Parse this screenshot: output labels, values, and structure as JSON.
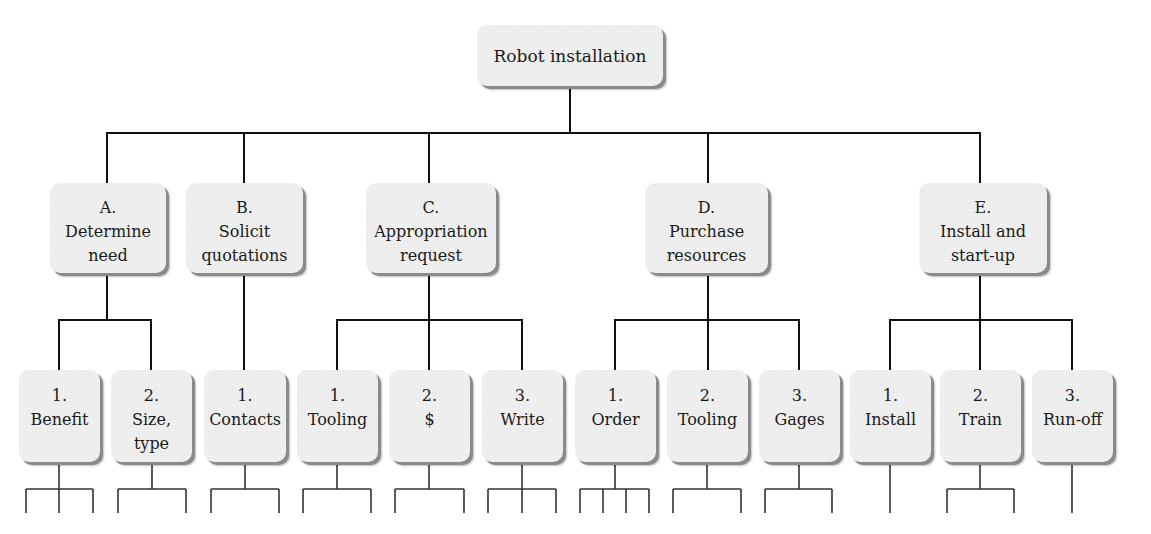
{
  "root": {
    "label": "Robot installation"
  },
  "branches": [
    {
      "letter": "A.",
      "line1": "Determine",
      "line2": "need",
      "children": [
        {
          "num": "1.",
          "line1": "Benefit",
          "line2": ""
        },
        {
          "num": "2.",
          "line1": "Size,",
          "line2": "type"
        }
      ]
    },
    {
      "letter": "B.",
      "line1": "Solicit",
      "line2": "quotations",
      "children": [
        {
          "num": "1.",
          "line1": "Contacts",
          "line2": ""
        }
      ]
    },
    {
      "letter": "C.",
      "line1": "Appropriation",
      "line2": "request",
      "children": [
        {
          "num": "1.",
          "line1": "Tooling",
          "line2": ""
        },
        {
          "num": "2.",
          "line1": "$",
          "line2": ""
        },
        {
          "num": "3.",
          "line1": "Write",
          "line2": ""
        }
      ]
    },
    {
      "letter": "D.",
      "line1": "Purchase",
      "line2": "resources",
      "children": [
        {
          "num": "1.",
          "line1": "Order",
          "line2": ""
        },
        {
          "num": "2.",
          "line1": "Tooling",
          "line2": ""
        },
        {
          "num": "3.",
          "line1": "Gages",
          "line2": ""
        }
      ]
    },
    {
      "letter": "E.",
      "line1": "Install and",
      "line2": "start-up",
      "children": [
        {
          "num": "1.",
          "line1": "Install",
          "line2": ""
        },
        {
          "num": "2.",
          "line1": "Train",
          "line2": ""
        },
        {
          "num": "3.",
          "line1": "Run-off",
          "line2": ""
        }
      ]
    }
  ],
  "level3_stub_counts": [
    3,
    2,
    2,
    2,
    2,
    3,
    4,
    2,
    2,
    1,
    2,
    1
  ],
  "colors": {
    "box_fill": "#efefef",
    "box_shadow": "#8a8a8a",
    "line": "#111111"
  }
}
